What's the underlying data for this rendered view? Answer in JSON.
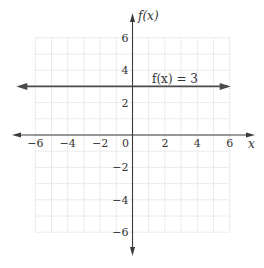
{
  "chart_data": {
    "type": "line",
    "title": "",
    "xlabel": "x",
    "ylabel": "f(x)",
    "xlim": [
      -6,
      6
    ],
    "ylim": [
      -6,
      6
    ],
    "grid": true,
    "grid_step": 1,
    "x_ticks": [
      -6,
      -4,
      -2,
      0,
      2,
      4,
      6
    ],
    "y_ticks": [
      6,
      4,
      2,
      -2,
      -4,
      -6
    ],
    "x_tick_labels": [
      "−6",
      "−4",
      "−2",
      "0",
      "2",
      "4",
      "6"
    ],
    "y_tick_labels": [
      "6",
      "4",
      "2",
      "−2",
      "−4",
      "−6"
    ],
    "series": [
      {
        "name": "f(x) = 3",
        "equation": "f(x) = 3",
        "x": [
          -6,
          6
        ],
        "y": [
          3,
          3
        ],
        "arrows_both_ends": true
      }
    ],
    "annotations": [
      {
        "text": "f(x) = 3",
        "x": 3.2,
        "y": 3.4
      }
    ],
    "legend": "none"
  },
  "labels": {
    "x_axis": "x",
    "y_axis": "f(x)",
    "function": "f(x) = 3",
    "origin": "0"
  },
  "colors": {
    "axis": "#3a3a3a",
    "grid": "#c8c8c8",
    "line": "#4a4a4a",
    "text": "#333333"
  }
}
